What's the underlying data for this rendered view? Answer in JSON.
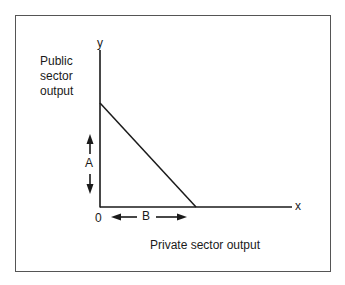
{
  "diagram": {
    "type": "production-possibility-frontier",
    "y_axis": {
      "symbol": "y",
      "label_lines": [
        "Public",
        "sector",
        "output"
      ]
    },
    "x_axis": {
      "symbol": "x",
      "label": "Private sector output"
    },
    "origin_label": "0",
    "arrows": [
      {
        "label": "A",
        "orientation": "vertical",
        "direction": "both"
      },
      {
        "label": "B",
        "orientation": "horizontal",
        "direction": "both"
      }
    ],
    "line": {
      "from": "y-intercept",
      "to": "x-intercept",
      "shape": "straight-downward-sloping"
    },
    "colors": {
      "stroke": "#1a1a1a",
      "frame": "#555555",
      "background": "#ffffff"
    }
  }
}
